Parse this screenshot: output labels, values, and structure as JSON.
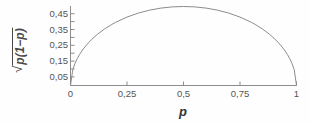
{
  "chart_data": {
    "type": "line",
    "title": "",
    "subtitle": "",
    "xlabel": "p",
    "ylabel": "√(p(1−p))",
    "ylabel_parts": {
      "radical": "√",
      "inner": "p(1−p)"
    },
    "xlim": [
      0,
      1
    ],
    "ylim": [
      0,
      0.5
    ],
    "xticks": [
      0,
      0.25,
      0.5,
      0.75,
      1
    ],
    "xticklabels": [
      "0",
      "0,25",
      "0,5",
      "0,75",
      "1"
    ],
    "yticks": [
      0.05,
      0.15,
      0.25,
      0.35,
      0.45
    ],
    "yticklabels": [
      "0,05",
      "0,15",
      "0,25",
      "0,35",
      "0,45"
    ],
    "grid": false,
    "legend": null,
    "series": [
      {
        "name": "sqrt(p(1-p))",
        "color": "#8c8c8c",
        "linewidth": 1,
        "x": [
          0,
          0.01,
          0.02,
          0.03,
          0.04,
          0.05,
          0.06,
          0.08,
          0.1,
          0.12,
          0.15,
          0.18,
          0.2,
          0.25,
          0.3,
          0.35,
          0.4,
          0.45,
          0.5,
          0.55,
          0.6,
          0.65,
          0.7,
          0.75,
          0.8,
          0.82,
          0.85,
          0.88,
          0.9,
          0.92,
          0.94,
          0.95,
          0.96,
          0.97,
          0.98,
          0.99,
          1
        ],
        "y": [
          0,
          0.0995,
          0.14,
          0.1706,
          0.196,
          0.2179,
          0.2375,
          0.2713,
          0.3,
          0.325,
          0.3571,
          0.3842,
          0.4,
          0.433,
          0.4583,
          0.477,
          0.4899,
          0.4975,
          0.5,
          0.4975,
          0.4899,
          0.477,
          0.4583,
          0.433,
          0.4,
          0.3842,
          0.3571,
          0.325,
          0.3,
          0.2713,
          0.2375,
          0.2179,
          0.196,
          0.1706,
          0.14,
          0.0995,
          0
        ]
      }
    ],
    "peak": {
      "x": 0.5,
      "y": 0.5
    },
    "axes_style": {
      "spines": [
        "left",
        "bottom"
      ],
      "axis_color": "#8c8c8c",
      "tick_direction": "in",
      "background": "#fefefe"
    }
  }
}
